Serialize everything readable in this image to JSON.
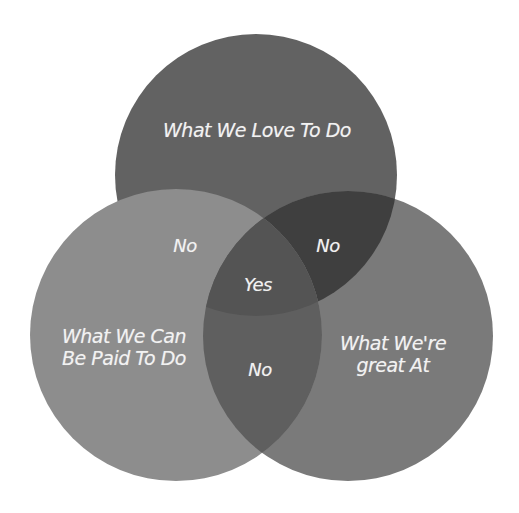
{
  "diagram": {
    "type": "venn",
    "circles": [
      {
        "id": "top",
        "label": "What We Love To Do",
        "cx": 256,
        "cy": 175,
        "r": 141
      },
      {
        "id": "left",
        "label_line1": "What We Can",
        "label_line2": "Be Paid To Do",
        "cx": 176,
        "cy": 335,
        "r": 146
      },
      {
        "id": "right",
        "label_line1": "What We're",
        "label_line2": "great At",
        "cx": 348,
        "cy": 336,
        "r": 145
      }
    ],
    "regions": {
      "top_left": "No",
      "top_right": "No",
      "left_right": "No",
      "center": "Yes"
    },
    "colors": {
      "background": "#ffffff",
      "top_only": "#626262",
      "left_only": "#8d8d8d",
      "right_only": "#7a7a7a",
      "top_right": "#3f3f3f",
      "left_right": "#5f5f5f",
      "center": "#545454",
      "text": "#f2f2f2"
    }
  }
}
